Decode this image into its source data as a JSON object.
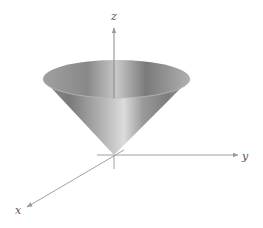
{
  "figure": {
    "axes": {
      "x": {
        "label": "x"
      },
      "y": {
        "label": "y"
      },
      "z": {
        "label": "z"
      }
    },
    "colors": {
      "axis": "#9a9a9a",
      "cone_dark": "#6e6e6e",
      "cone_light": "#d8d8d8",
      "label": "#555555",
      "background": "#ffffff"
    }
  }
}
